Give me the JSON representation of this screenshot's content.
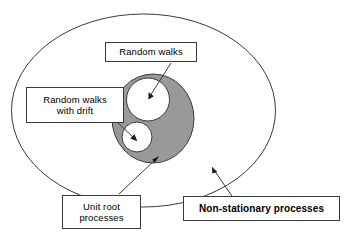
{
  "figure": {
    "type": "venn-diagram",
    "colors": {
      "outline": "#3a3a3a",
      "shaded_fill": "#999999",
      "circle_fill": "#ffffff",
      "background": "#ffffff",
      "text": "#000000"
    },
    "regions": [
      {
        "name": "non-stationary-processes-ellipse",
        "label": "Non-stationary processes",
        "fill": "#ffffff",
        "shape": "ellipse"
      },
      {
        "name": "unit-root-processes-ellipse",
        "label": "Unit root processes",
        "fill": "#999999",
        "shape": "ellipse"
      },
      {
        "name": "random-walks-circle",
        "label": "Random walks",
        "fill": "#ffffff",
        "shape": "circle"
      },
      {
        "name": "random-walks-with-drift-circle",
        "label": "Random walks with drift",
        "fill": "#ffffff",
        "shape": "circle"
      }
    ]
  },
  "labels": {
    "random_walks": "Random walks",
    "random_walks_with_drift": "Random walks\nwith drift",
    "unit_root_processes": "Unit root\nprocesses",
    "non_stationary_processes": "Non-stationary processes"
  }
}
